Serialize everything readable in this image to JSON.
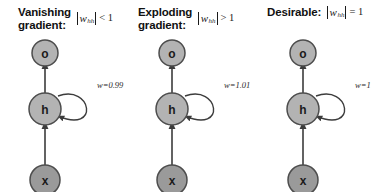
{
  "figure": {
    "background_color": "#ffffff",
    "panel_count": 3
  },
  "style": {
    "node_fill_light": "#b3b3b3",
    "node_fill_dark": "#9a9a9a",
    "node_stroke": "#4d4d4d",
    "edge_color": "#3c3c3c",
    "text_color": "#111111"
  },
  "panels": [
    {
      "title_line1": "Vanishing",
      "title_line2": "gradient:",
      "math": {
        "variable": "w",
        "subscript": "hh",
        "relation": "< 1",
        "full": "|w_hh| < 1"
      },
      "nodes": [
        {
          "id": "o",
          "label": "o",
          "shade": "light"
        },
        {
          "id": "h",
          "label": "h",
          "shade": "light"
        },
        {
          "id": "x",
          "label": "x",
          "shade": "dark"
        }
      ],
      "edges": [
        {
          "from": "x",
          "to": "h",
          "label": ""
        },
        {
          "from": "h",
          "to": "o",
          "label": ""
        },
        {
          "from": "h",
          "to": "h",
          "label": "w=0.99",
          "type": "self-loop"
        }
      ],
      "weight_label": "w=0.99"
    },
    {
      "title_line1": "Exploding",
      "title_line2": "gradient:",
      "math": {
        "variable": "w",
        "subscript": "hh",
        "relation": "> 1",
        "full": "|w_hh| > 1"
      },
      "nodes": [
        {
          "id": "o",
          "label": "o",
          "shade": "light"
        },
        {
          "id": "h",
          "label": "h",
          "shade": "light"
        },
        {
          "id": "x",
          "label": "x",
          "shade": "dark"
        }
      ],
      "edges": [
        {
          "from": "x",
          "to": "h",
          "label": ""
        },
        {
          "from": "h",
          "to": "o",
          "label": ""
        },
        {
          "from": "h",
          "to": "h",
          "label": "w=1.01",
          "type": "self-loop"
        }
      ],
      "weight_label": "w=1.01"
    },
    {
      "title_line1": "Desirable:",
      "title_line2": "",
      "math": {
        "variable": "w",
        "subscript": "hh",
        "relation": "= 1",
        "full": "|w_hh| = 1"
      },
      "nodes": [
        {
          "id": "o",
          "label": "o",
          "shade": "light"
        },
        {
          "id": "h",
          "label": "h",
          "shade": "light"
        },
        {
          "id": "x",
          "label": "x",
          "shade": "dark"
        }
      ],
      "edges": [
        {
          "from": "x",
          "to": "h",
          "label": ""
        },
        {
          "from": "h",
          "to": "o",
          "label": ""
        },
        {
          "from": "h",
          "to": "h",
          "label": "w=1",
          "type": "self-loop"
        }
      ],
      "weight_label": "w=1"
    }
  ]
}
